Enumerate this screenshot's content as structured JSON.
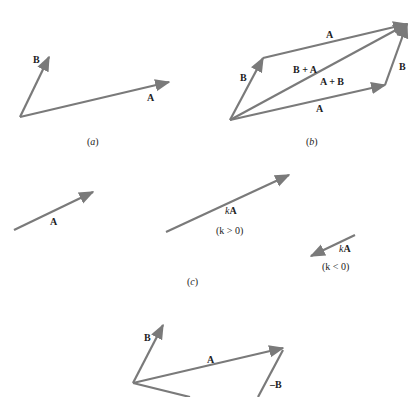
{
  "figure": {
    "panel_a": {
      "caption_open": "(",
      "caption_letter": "a",
      "caption_close": ")",
      "labels": {
        "A": "A",
        "B": "B"
      }
    },
    "panel_b": {
      "caption_open": "(",
      "caption_letter": "b",
      "caption_close": ")",
      "labels": {
        "A_top": "A",
        "A_bottom": "A",
        "B_left": "B",
        "B_right": "B",
        "B_plus_A": "B + A",
        "A_plus_B": "A + B"
      }
    },
    "panel_c": {
      "caption_open": "(",
      "caption_letter": "c",
      "caption_close": ")",
      "labels": {
        "A": "A",
        "k_pos_k": "k",
        "k_pos_A": "A",
        "k_pos_cond": "(k > 0)",
        "k_neg_k": "k",
        "k_neg_A": "A",
        "k_neg_cond": "(k < 0)"
      }
    },
    "panel_d": {
      "labels": {
        "B": "B",
        "A": "A",
        "neg_B": "–B"
      }
    },
    "colors": {
      "vector": "#7a7a7a",
      "text": "#222222",
      "background": "#ffffff"
    }
  }
}
